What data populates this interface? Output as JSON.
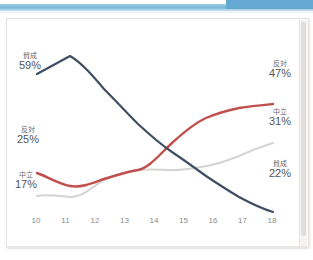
{
  "window": {
    "topbar_color": "#7ab8da",
    "topbar_block_color": "#64a9d2"
  },
  "chart_data": {
    "type": "line",
    "title": "",
    "xlabel": "",
    "ylabel": "",
    "x": [
      10,
      11,
      12,
      13,
      14,
      15,
      16,
      17,
      18
    ],
    "tick_labels": [
      "10",
      "11",
      "12",
      "13",
      "14",
      "15",
      "16",
      "17",
      "18"
    ],
    "xlim": [
      10,
      18
    ],
    "ylim": [
      0,
      65
    ],
    "grid": false,
    "legend": "none (inline end labels)",
    "smoothing": "spline",
    "series": [
      {
        "name": "賛成",
        "color": "#3f4f63",
        "values": [
          59,
          62,
          53,
          45,
          38,
          33,
          29,
          25,
          22
        ],
        "start_label": "賛成",
        "start_value": "59%",
        "end_label": "賛成",
        "end_value": "22%"
      },
      {
        "name": "反対",
        "color": "#c0504d",
        "values": [
          25,
          20,
          23,
          26,
          35,
          41,
          44,
          46,
          47
        ],
        "start_label": "反対",
        "start_value": "25%",
        "end_label": "反対",
        "end_value": "47%"
      },
      {
        "name": "中立",
        "color": "#d6d4d2",
        "values": [
          17,
          17,
          22,
          26,
          26,
          26,
          27,
          29,
          31
        ],
        "start_label": "中立",
        "start_value": "17%",
        "end_label": "中立",
        "end_value": "31%"
      }
    ]
  },
  "labels": {
    "agree_start_name": "賛成",
    "agree_start_value": "59%",
    "oppose_start_name": "反対",
    "oppose_start_value": "25%",
    "neutral_start_name": "中立",
    "neutral_start_value": "17%",
    "oppose_end_name": "反対",
    "oppose_end_value": "47%",
    "neutral_end_name": "中立",
    "neutral_end_value": "31%",
    "agree_end_name": "賛成",
    "agree_end_value": "22%"
  }
}
